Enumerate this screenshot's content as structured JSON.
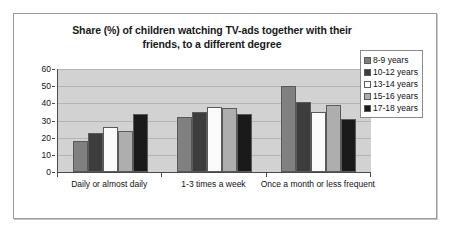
{
  "chart_data": {
    "type": "bar",
    "title": "Share (%) of children watching TV-ads together with their friends, to a different degree",
    "title_line1": "Share (%) of children watching TV-ads together with their",
    "title_line2": "friends, to a different degree",
    "xlabel": "",
    "ylabel": "",
    "ylim": [
      0,
      60
    ],
    "yticks": [
      0,
      10,
      20,
      30,
      40,
      50,
      60
    ],
    "grid": true,
    "legend_position": "right",
    "categories": [
      "Daily or almost daily",
      "1-3 times a week",
      "Once a month or less frequent"
    ],
    "series": [
      {
        "name": "8-9 years",
        "color": "#808080",
        "values": [
          18,
          32,
          50
        ]
      },
      {
        "name": "10-12 years",
        "color": "#3d3d3d",
        "values": [
          23,
          35,
          41
        ]
      },
      {
        "name": "13-14 years",
        "color": "#fbfbfb",
        "values": [
          26,
          38,
          35
        ]
      },
      {
        "name": "15-16 years",
        "color": "#aeaeae",
        "values": [
          24,
          37,
          39
        ]
      },
      {
        "name": "17-18 years",
        "color": "#1a1a1a",
        "values": [
          34,
          34,
          31
        ]
      }
    ],
    "plot_background": "#d2d2d2",
    "axis_color": "#4a4a4a"
  }
}
